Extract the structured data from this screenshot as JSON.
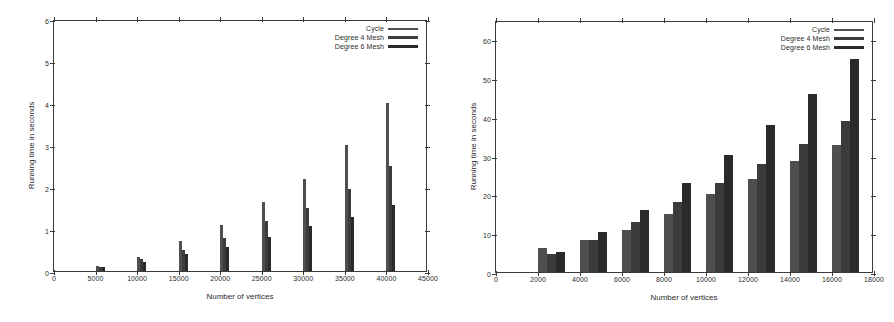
{
  "figure": {
    "panels": [
      "left",
      "right"
    ]
  },
  "chart_data": [
    {
      "id": "left",
      "type": "bar",
      "title": "",
      "xlabel": "Number of vertices",
      "ylabel": "Running time in seconds",
      "xlim": [
        0,
        45000
      ],
      "ylim": [
        0,
        6
      ],
      "xticks": [
        0,
        5000,
        10000,
        15000,
        20000,
        25000,
        30000,
        35000,
        40000,
        45000
      ],
      "xticklabels": [
        "0",
        "5000",
        "10000",
        "15000",
        "20000",
        "25000",
        "30000",
        "35000",
        "40000",
        "45000"
      ],
      "yticks": [
        0,
        1,
        2,
        3,
        4,
        5,
        6
      ],
      "yticklabels": [
        "0",
        "1",
        "2",
        "3",
        "4",
        "5",
        "6"
      ],
      "grid": false,
      "legend_position": "top-right",
      "categories": [
        5000,
        10000,
        15000,
        20000,
        25000,
        30000,
        35000,
        40000
      ],
      "bar_width": 3,
      "series": [
        {
          "name": "Cycle",
          "values": [
            0.12,
            0.33,
            0.72,
            1.1,
            1.65,
            2.2,
            3.0,
            4.0
          ]
        },
        {
          "name": "Degree 4 Mesh",
          "values": [
            0.1,
            0.28,
            0.5,
            0.79,
            1.19,
            1.5,
            1.95,
            2.5
          ]
        },
        {
          "name": "Degree 6 Mesh",
          "values": [
            0.09,
            0.21,
            0.41,
            0.58,
            0.8,
            1.08,
            1.28,
            1.58
          ]
        }
      ]
    },
    {
      "id": "right",
      "type": "bar",
      "title": "",
      "xlabel": "Number of vertices",
      "ylabel": "Running time in seconds",
      "xlim": [
        0,
        18000
      ],
      "ylim": [
        0,
        65
      ],
      "xticks": [
        0,
        2000,
        4000,
        6000,
        8000,
        10000,
        12000,
        14000,
        16000,
        18000
      ],
      "xticklabels": [
        "0",
        "2000",
        "4000",
        "6000",
        "8000",
        "10000",
        "12000",
        "14000",
        "16000",
        "18000"
      ],
      "yticks": [
        0,
        10,
        20,
        30,
        40,
        50,
        60
      ],
      "yticklabels": [
        "0",
        "10",
        "20",
        "30",
        "40",
        "50",
        "60"
      ],
      "grid": false,
      "legend_position": "top-right",
      "categories": [
        2000,
        4000,
        6000,
        8000,
        10000,
        12000,
        14000,
        16000
      ],
      "bar_width": 420,
      "series": [
        {
          "name": "Cycle",
          "values": [
            6.2,
            8.3,
            10.9,
            15.0,
            20.0,
            24.0,
            28.6,
            32.8
          ]
        },
        {
          "name": "Degree 4 Mesh",
          "values": [
            4.7,
            8.3,
            12.9,
            18.0,
            23.0,
            27.8,
            33.0,
            39.0
          ]
        },
        {
          "name": "Degree 6 Mesh",
          "values": [
            5.2,
            10.2,
            16.0,
            23.0,
            30.3,
            38.0,
            46.0,
            55.0
          ]
        }
      ]
    }
  ],
  "legend": {
    "entries": [
      {
        "label": "Cycle",
        "color": "#4f4f4f"
      },
      {
        "label": "Degree 4 Mesh",
        "color": "#3b3b3b"
      },
      {
        "label": "Degree 6 Mesh",
        "color": "#2a2a2a"
      }
    ]
  }
}
